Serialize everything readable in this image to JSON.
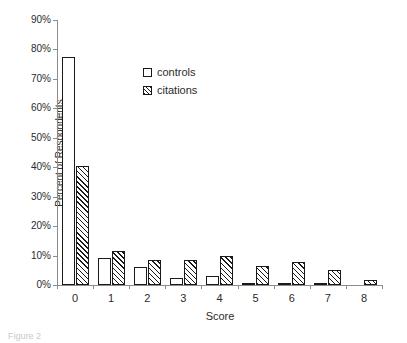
{
  "chart_data": {
    "type": "bar",
    "title": "",
    "xlabel": "Score",
    "ylabel": "Percent of Respondents",
    "categories": [
      "0",
      "1",
      "2",
      "3",
      "4",
      "5",
      "6",
      "7",
      "8"
    ],
    "series": [
      {
        "name": "controls",
        "fill": "white",
        "values": [
          77.5,
          9.2,
          6.1,
          2.4,
          3.0,
          0.5,
          0.5,
          0.5,
          0.0
        ]
      },
      {
        "name": "citations",
        "fill": "diagonal-hatch",
        "values": [
          40.5,
          11.7,
          8.4,
          8.4,
          9.7,
          6.4,
          7.9,
          5.1,
          1.7
        ]
      }
    ],
    "ylim": [
      0,
      90
    ],
    "ytick_values": [
      0,
      10,
      20,
      30,
      40,
      50,
      60,
      70,
      80,
      90
    ],
    "ytick_labels": [
      "0%",
      "10%",
      "20%",
      "30%",
      "40%",
      "50%",
      "60%",
      "70%",
      "80%",
      "90%"
    ],
    "grid": false,
    "legend_position": "upper-center-inside",
    "axis_color": "#8d8d8d",
    "bar_outline_color": "#1a1a1a",
    "text_color": "#2b2b2b"
  },
  "legend": {
    "items": [
      {
        "label": "controls"
      },
      {
        "label": "citations"
      }
    ]
  },
  "caption": {
    "text": "Figure 2"
  }
}
